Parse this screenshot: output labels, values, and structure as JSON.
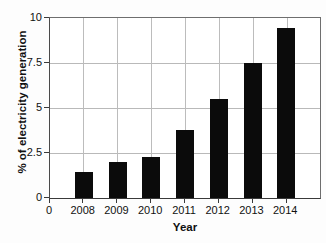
{
  "chart_data": {
    "type": "bar",
    "title": "",
    "xlabel": "Year",
    "ylabel": "% of electricity generation",
    "categories": [
      "2008",
      "2009",
      "2010",
      "2011",
      "2012",
      "2013",
      "2014"
    ],
    "values": [
      1.45,
      2.0,
      2.3,
      3.8,
      5.5,
      7.5,
      9.45
    ],
    "series": [
      {
        "name": "% of electricity generation",
        "values": [
          1.45,
          2.0,
          2.3,
          3.8,
          5.5,
          7.5,
          9.45
        ]
      }
    ],
    "ylim": [
      0,
      10
    ],
    "yticks": [
      "0",
      "2.5",
      "5",
      "7.5",
      "10"
    ],
    "ytick_values": [
      0,
      2.5,
      5,
      7.5,
      10
    ],
    "xticks": [
      "0",
      "2008",
      "2009",
      "2010",
      "2011",
      "2012",
      "2013",
      "2014"
    ],
    "grid": true,
    "grid_axis": "both",
    "legend": "none",
    "bar_color": "#0b0b0b",
    "grid_color": "#b9b9b9",
    "axis_color": "#3a3a3a",
    "background_color": "#ffffff"
  }
}
